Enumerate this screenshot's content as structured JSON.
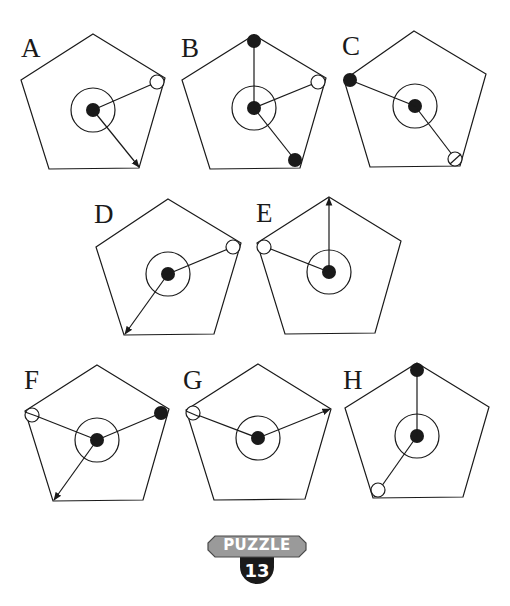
{
  "figures": [
    {
      "label": "A"
    },
    {
      "label": "B"
    },
    {
      "label": "C"
    },
    {
      "label": "D"
    },
    {
      "label": "E"
    },
    {
      "label": "F"
    },
    {
      "label": "G"
    },
    {
      "label": "H"
    }
  ],
  "badge": {
    "title": "PUZZLE",
    "number": "13",
    "colors": {
      "top": "#9a9a9a",
      "bottom": "#1a1a1a",
      "text": "#ffffff"
    }
  }
}
